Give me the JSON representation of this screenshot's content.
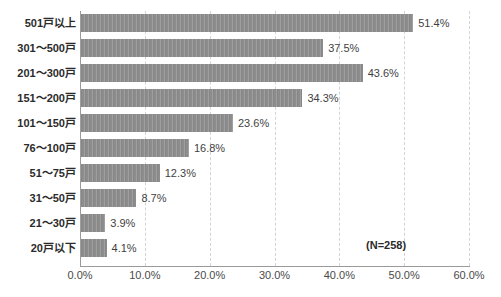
{
  "chart_data": {
    "type": "bar",
    "orientation": "horizontal",
    "title": "",
    "subtitle": "",
    "xlabel": "",
    "ylabel": "",
    "xlim": [
      0,
      60
    ],
    "ylim": null,
    "grid": true,
    "legend": null,
    "legend_position": "none",
    "categories": [
      "501戸以上",
      "301～500戸",
      "201～300戸",
      "151～200戸",
      "101～150戸",
      "76～100戸",
      "51～75戸",
      "31～50戸",
      "21～30戸",
      "20戸以下"
    ],
    "values": [
      51.4,
      37.5,
      43.6,
      34.3,
      23.6,
      16.8,
      12.3,
      8.7,
      3.9,
      4.1
    ],
    "value_labels": [
      "51.4%",
      "37.5%",
      "43.6%",
      "34.3%",
      "23.6%",
      "16.8%",
      "12.3%",
      "8.7%",
      "3.9%",
      "4.1%"
    ],
    "x_ticks": [
      0,
      10,
      20,
      30,
      40,
      50,
      60
    ],
    "x_tick_labels": [
      "0.0%",
      "10.0%",
      "20.0%",
      "30.0%",
      "40.0%",
      "50.0%",
      "60.0%"
    ],
    "annotations": [
      {
        "text": "(N=258)",
        "x": 50.3,
        "y_index": 9
      }
    ],
    "colors": {
      "bar": "#8d8d8d",
      "gridline": "#d3d3d3",
      "axis": "#9a9a9a",
      "text": "#2b2b2b",
      "background": "#ffffff"
    }
  }
}
